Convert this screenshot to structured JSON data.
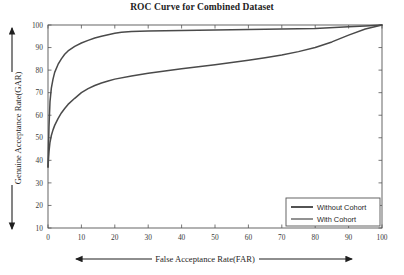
{
  "chart_data": {
    "type": "line",
    "title": "ROC Curve for Combined Dataset",
    "xlabel": "False Acceptance Rate(FAR)",
    "ylabel": "Genuine Acceptance Rate(GAR)",
    "xlim": [
      0,
      100
    ],
    "ylim": [
      10,
      100
    ],
    "xticks": [
      0,
      10,
      20,
      30,
      40,
      50,
      60,
      70,
      80,
      90,
      100
    ],
    "yticks": [
      10,
      20,
      30,
      40,
      50,
      60,
      70,
      80,
      90,
      100
    ],
    "grid": false,
    "legend_position": "bottom-right",
    "line_color": "#4a4a4a",
    "axis_color": "#555555",
    "background": "#ffffff",
    "series": [
      {
        "name": "Without Cohort",
        "color": "#4a4a4a",
        "width": 1.5,
        "x": [
          0,
          0.3,
          0.6,
          1,
          1.5,
          2,
          3,
          4,
          5,
          6,
          8,
          10,
          12,
          14,
          16,
          18,
          20,
          22,
          25,
          30,
          35,
          40,
          50,
          60,
          70,
          80,
          90,
          95,
          100
        ],
        "y": [
          37,
          55,
          66,
          72,
          76,
          79,
          82.5,
          85,
          87,
          88.5,
          90.5,
          92,
          93.2,
          94.2,
          95,
          95.7,
          96.3,
          96.8,
          97.1,
          97.3,
          97.5,
          97.6,
          97.8,
          98,
          98.2,
          98.5,
          99.2,
          99.6,
          100
        ]
      },
      {
        "name": "With Cohort",
        "color": "#4a4a4a",
        "width": 1.5,
        "x": [
          0,
          0.3,
          0.6,
          1,
          1.5,
          2,
          3,
          4,
          5,
          6,
          8,
          10,
          12,
          14,
          16,
          18,
          20,
          25,
          30,
          35,
          40,
          45,
          50,
          55,
          60,
          65,
          70,
          75,
          80,
          85,
          90,
          95,
          100
        ],
        "y": [
          37,
          44,
          48,
          51,
          53.5,
          55.5,
          58.5,
          61,
          63,
          64.8,
          67.5,
          70,
          71.8,
          73.2,
          74.3,
          75.2,
          76,
          77.4,
          78.6,
          79.6,
          80.6,
          81.5,
          82.4,
          83.4,
          84.4,
          85.5,
          86.7,
          88.2,
          90,
          92.5,
          95.5,
          98.2,
          100
        ]
      }
    ]
  },
  "legend": {
    "items": [
      {
        "label": "Without Cohort"
      },
      {
        "label": "With Cohort"
      }
    ]
  }
}
